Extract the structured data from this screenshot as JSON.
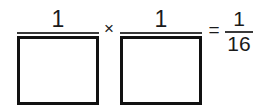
{
  "problem": {
    "type": "fraction-multiplication-fill-in-the-blank",
    "expression_text": "1/[ ] × 1/[ ] = 1/16",
    "terms": [
      {
        "id": "factor-1",
        "numerator": "1",
        "denominator_value": "",
        "denominator_is_blank_box": true
      },
      {
        "id": "factor-2",
        "numerator": "1",
        "denominator_value": "",
        "denominator_is_blank_box": true
      }
    ],
    "operators": {
      "multiply": "×",
      "equals": "="
    },
    "result": {
      "id": "result-fraction",
      "numerator": "1",
      "denominator": "16"
    }
  },
  "style": {
    "background": "#ffffff",
    "ink": "#111111",
    "rule": "#3a3a3a"
  }
}
